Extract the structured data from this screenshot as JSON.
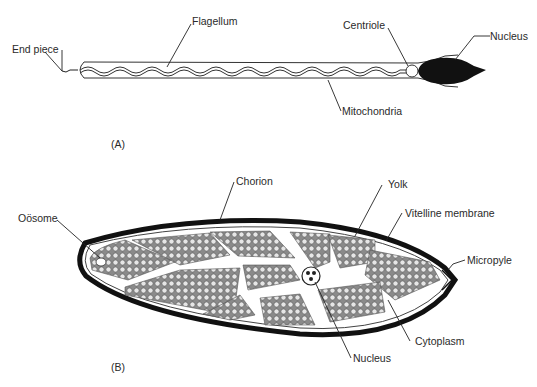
{
  "panel_a": {
    "caption": "(A)",
    "subject": "sperm",
    "labels": {
      "end_piece": "End piece",
      "flagellum": "Flagellum",
      "centriole": "Centriole",
      "nucleus": "Nucleus",
      "mitochondria": "Mitochondria"
    }
  },
  "panel_b": {
    "caption": "(B)",
    "subject": "egg",
    "labels": {
      "oosome": "Oösome",
      "chorion": "Chorion",
      "yolk": "Yolk",
      "vitelline_membrane": "Vitelline membrane",
      "micropyle": "Micropyle",
      "cytoplasm": "Cytoplasm",
      "nucleus": "Nucleus"
    }
  },
  "colors": {
    "ink": "#1a1a1a",
    "yolk_fill": "#cfcfcf",
    "background": "#ffffff"
  }
}
